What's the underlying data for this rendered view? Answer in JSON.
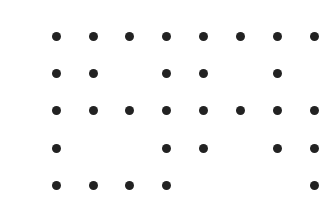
{
  "diagram": {
    "type": "dot-grid",
    "dot_color": "#222222",
    "background": "#ffffff",
    "columns_x": [
      56,
      93,
      129,
      166,
      203,
      240,
      277,
      314
    ],
    "rows_y": [
      36,
      73,
      110,
      148,
      185
    ],
    "rows": [
      [
        1,
        1,
        1,
        1,
        1,
        1,
        1,
        1
      ],
      [
        1,
        1,
        0,
        1,
        1,
        0,
        1,
        0
      ],
      [
        1,
        1,
        1,
        1,
        1,
        1,
        1,
        1
      ],
      [
        1,
        0,
        0,
        1,
        1,
        0,
        1,
        1
      ],
      [
        1,
        1,
        1,
        1,
        0,
        0,
        0,
        1
      ]
    ]
  }
}
